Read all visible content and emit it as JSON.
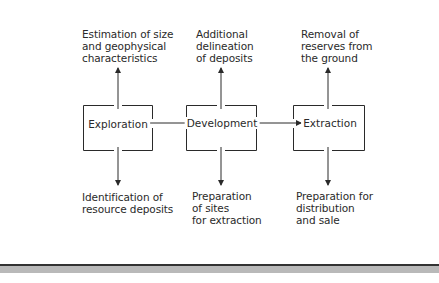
{
  "diagram": {
    "stages": [
      {
        "name": "Exploration",
        "above": "Estimation of size\nand geophysical\ncharacteristics",
        "below": "Identification of\nresource deposits"
      },
      {
        "name": "Development",
        "above": "Additional\ndelineation\nof deposits",
        "below": "Preparation\nof sites\nfor extraction"
      },
      {
        "name": "Extraction",
        "above": "Removal of\nreserves from\nthe ground",
        "below": "Preparation for\ndistribution\nand sale"
      }
    ],
    "colors": {
      "line": "#2a2a2a",
      "bar_dark": "#333333",
      "bar_gray": "#b9b9b9"
    }
  }
}
